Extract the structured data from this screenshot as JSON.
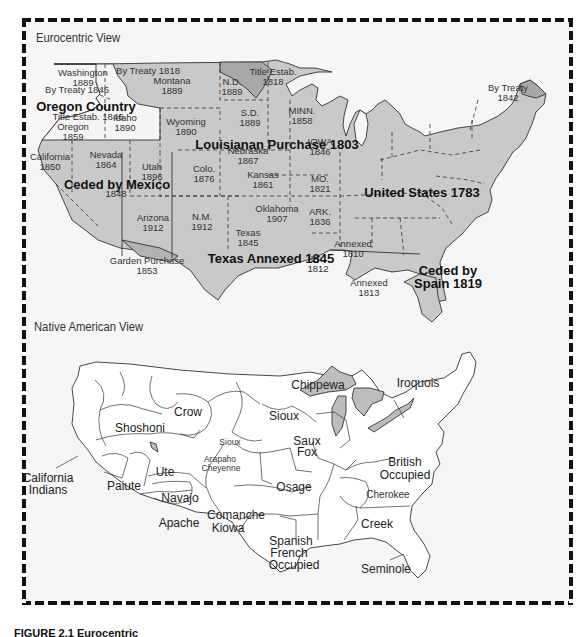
{
  "figure": {
    "caption_fragment": "FIGURE 2.1  Eurocentric"
  },
  "colors": {
    "frame_background": "#f6f6f6",
    "territory_fill": "#c9c9c9",
    "highlight_fill": "#a8a8a8",
    "lake_fill": "#bdbdbd",
    "region_fill": "#ffffff",
    "line": "#333333"
  },
  "eurocentric": {
    "title": "Eurocentric View",
    "labels": {
      "washington": [
        "Washington",
        "1889"
      ],
      "by_treaty_1846": "By Treaty 1846",
      "by_treaty_1818": "By Treaty 1818",
      "montana": [
        "Montana",
        "1889"
      ],
      "nd": [
        "N.D.",
        "1889"
      ],
      "title_estab_1818": [
        "Title Estab.",
        "1818"
      ],
      "oregon_country": "Oregon Country",
      "title_estab_1846": "Title Estab. 1846",
      "idaho": [
        "Idaho",
        "1890"
      ],
      "oregon": [
        "Oregon",
        "1859"
      ],
      "sd": [
        "S.D.",
        "1889"
      ],
      "minn": [
        "MINN.",
        "1858"
      ],
      "wyoming": [
        "Wyoming",
        "1890"
      ],
      "louisiana_purchase": "Louisianan Purchase 1803",
      "iowa": [
        "IOWA",
        "1846"
      ],
      "nebraska": [
        "Nebraska",
        "1867"
      ],
      "california": [
        "California",
        "1850"
      ],
      "nevada": [
        "Nevada",
        "1864"
      ],
      "utah": [
        "Utah",
        "1896"
      ],
      "colo": [
        "Colo.",
        "1876"
      ],
      "kansas": [
        "Kansas",
        "1861"
      ],
      "mo": [
        "MO.",
        "1821"
      ],
      "ceded_by_mexico": "Ceded by Mexico",
      "ceded_by_mexico_year": "1848",
      "united_states": "United States 1783",
      "oklahoma": [
        "Oklahoma",
        "1907"
      ],
      "ark": [
        "ARK.",
        "1836"
      ],
      "arizona": [
        "Arizona",
        "1912"
      ],
      "nm": [
        "N.M.",
        "1912"
      ],
      "texas": [
        "Texas",
        "1845"
      ],
      "annexed_1810": [
        "Annexed",
        "1810"
      ],
      "garden_purchase": [
        "Garden Purchase",
        "1853"
      ],
      "texas_annexed": "Texas Annexed 1845",
      "la": [
        "LA.",
        "1812"
      ],
      "annexed_1813": [
        "Annexed",
        "1813"
      ],
      "ceded_by_spain": [
        "Ceded by",
        "Spain 1819"
      ],
      "by_treaty_1842": [
        "By Treaty",
        "1842"
      ]
    }
  },
  "native_american": {
    "title": "Native American View",
    "tribes": {
      "chippewa": "Chippewa",
      "iroquois": "Iroquois",
      "crow": "Crow",
      "sioux": "Sioux",
      "sioux_small": "Sioux",
      "shoshoni": "Shoshoni",
      "saux_fox": [
        "Saux",
        "Fox"
      ],
      "arapaho_cheyenne": [
        "Arapaho",
        "Cheyenne"
      ],
      "california_indians": [
        "California",
        "Indians"
      ],
      "ute": "Ute",
      "paiute": "Paiute",
      "navajo": "Navajo",
      "osage": "Osage",
      "british_occupied": [
        "British",
        "Occupied"
      ],
      "cherokee": "Cherokee",
      "apache": "Apache",
      "comanche_kiowa": [
        "Comanche",
        "Kiowa"
      ],
      "creek": "Creek",
      "spanish_french_occupied": [
        "Spanish",
        "French",
        "Occupied"
      ],
      "seminole": "Seminole"
    }
  }
}
